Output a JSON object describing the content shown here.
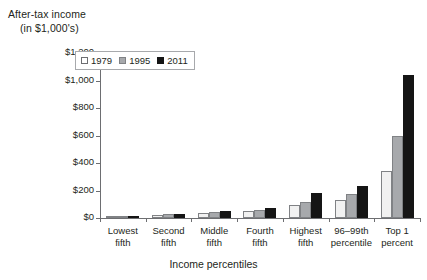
{
  "chart_data": {
    "type": "bar",
    "title": "",
    "ylabel": "After-tax income\n(in $1,000's)",
    "ylabel_line1": "After-tax income",
    "ylabel_line2": "(in $1,000's)",
    "xlabel": "Income percentiles",
    "categories": [
      "Lowest\nfifth",
      "Second\nfifth",
      "Middle\nfifth",
      "Fourth\nfifth",
      "Highest\nfifth",
      "96–99th\npercentile",
      "Top 1\npercent"
    ],
    "series": [
      {
        "name": "1979",
        "color": "#f1f1f1",
        "values": [
          9,
          22,
          35,
          48,
          95,
          130,
          340
        ]
      },
      {
        "name": "1995",
        "color": "#a7a9ac",
        "values": [
          11,
          26,
          42,
          58,
          120,
          175,
          600
        ]
      },
      {
        "name": "2011",
        "color": "#151515",
        "values": [
          15,
          32,
          50,
          72,
          185,
          230,
          1040
        ]
      }
    ],
    "ylim": [
      0,
      1200
    ],
    "yticks": [
      0,
      200,
      400,
      600,
      800,
      1000,
      1200
    ],
    "ytick_labels": [
      "$0",
      "$200",
      "$400",
      "$600",
      "$800",
      "$1,000",
      "$1,200"
    ],
    "grid": false,
    "legend_position": "top-left",
    "legend_entries": [
      "1979",
      "1995",
      "2011"
    ]
  }
}
